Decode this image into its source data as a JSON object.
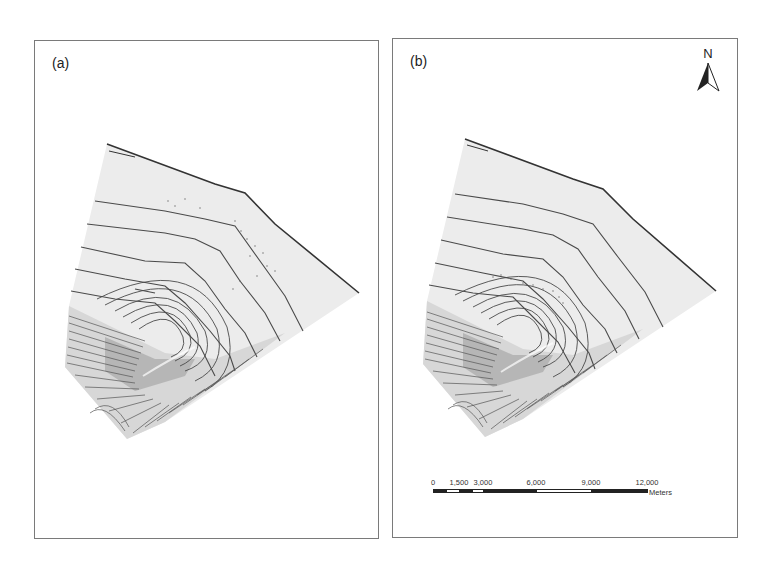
{
  "figure": {
    "panels": [
      {
        "id": "a",
        "label": "(a)",
        "contour_labels": [
          "0.00",
          "0.00",
          "1.00",
          "1.00",
          "2.00",
          "2.00",
          "3.00",
          "3.00",
          "4.00",
          "4.00",
          "5.00",
          "5.00",
          "10.00",
          "10.00",
          "12.00",
          "15.00",
          "1.00",
          "2.00",
          "3.00",
          "4.00"
        ]
      },
      {
        "id": "b",
        "label": "(b)",
        "contour_labels": [
          "1.00",
          "1.00",
          "2.00",
          "2.00",
          "3.00",
          "3.00",
          "4.00",
          "4.00",
          "5.00",
          "5.00",
          "10.00",
          "10.00",
          "12.00",
          "15.00",
          "1.00",
          "2.00",
          "3.00",
          "4.00"
        ]
      }
    ],
    "north_arrow": {
      "letter": "N"
    },
    "scale_bar": {
      "ticks": [
        "0",
        "1,500",
        "3,000",
        "6,000",
        "9,000",
        "12,000"
      ],
      "units": "Meters"
    },
    "colors": {
      "land_fill": "#ececec",
      "contour": "#4a4a4a",
      "frame": "#7a7a7a"
    }
  }
}
